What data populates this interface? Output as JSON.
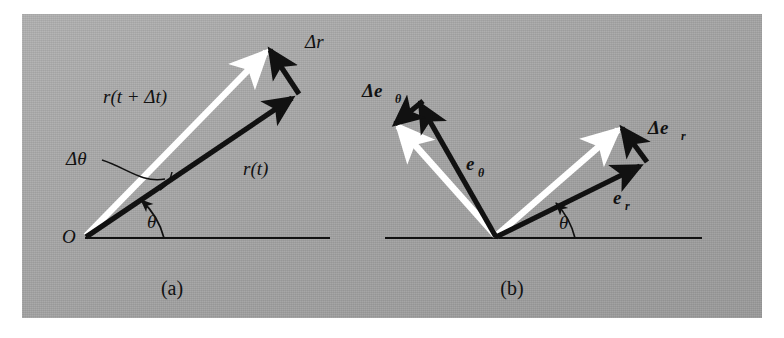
{
  "figure": {
    "background_color": "#ffffff",
    "plate_color": "#a8a8a8",
    "ink_color": "#111111",
    "highlight_color": "#ffffff"
  },
  "panels": [
    {
      "id": "a",
      "caption": "(a)",
      "origin_label": "O",
      "angle_label": "θ",
      "delta_angle_label": "Δθ",
      "vectors": [
        {
          "name": "position-vector-t",
          "label": "r(t)",
          "style": "black",
          "label_x": 243,
          "label_y": 175
        },
        {
          "name": "position-vector-t-plus-dt",
          "label": "r(t + Δt)",
          "style": "white",
          "label_x": 103,
          "label_y": 103
        },
        {
          "name": "delta-r-vector",
          "label": "Δr",
          "style": "black",
          "label_x": 305,
          "label_y": 47
        }
      ]
    },
    {
      "id": "b",
      "caption": "(b)",
      "angle_label": "θ",
      "vectors": [
        {
          "name": "unit-vector-e-r",
          "label": "e",
          "sub": "r",
          "style": "black",
          "label_x": 613,
          "label_y": 204
        },
        {
          "name": "unit-vector-e-theta",
          "label": "e",
          "sub": "θ",
          "style": "black",
          "label_x": 470,
          "label_y": 170
        },
        {
          "name": "delta-e-r-vector",
          "label": "Δe",
          "sub": "r",
          "style": "black",
          "label_x": 650,
          "label_y": 133
        },
        {
          "name": "delta-e-theta-vector",
          "label": "Δe",
          "sub": "θ",
          "style": "black",
          "label_x": 364,
          "label_y": 96
        },
        {
          "name": "unit-vector-e-r-displaced",
          "label": "",
          "style": "white"
        },
        {
          "name": "unit-vector-e-theta-displaced",
          "label": "",
          "style": "white"
        }
      ]
    }
  ],
  "labels": {
    "panel_a_r_t": "r(t)",
    "panel_a_r_t_dt": "r(t + Δt)",
    "panel_a_delta_r": "Δr",
    "panel_a_delta_theta": "Δθ",
    "panel_a_theta": "θ",
    "panel_a_origin": "O",
    "panel_a_caption": "(a)",
    "panel_b_e_base": "e",
    "panel_b_e_r_sub": "r",
    "panel_b_e_theta_sub": "θ",
    "panel_b_delta_e_base": "Δe",
    "panel_b_theta": "θ",
    "panel_b_caption": "(b)"
  }
}
